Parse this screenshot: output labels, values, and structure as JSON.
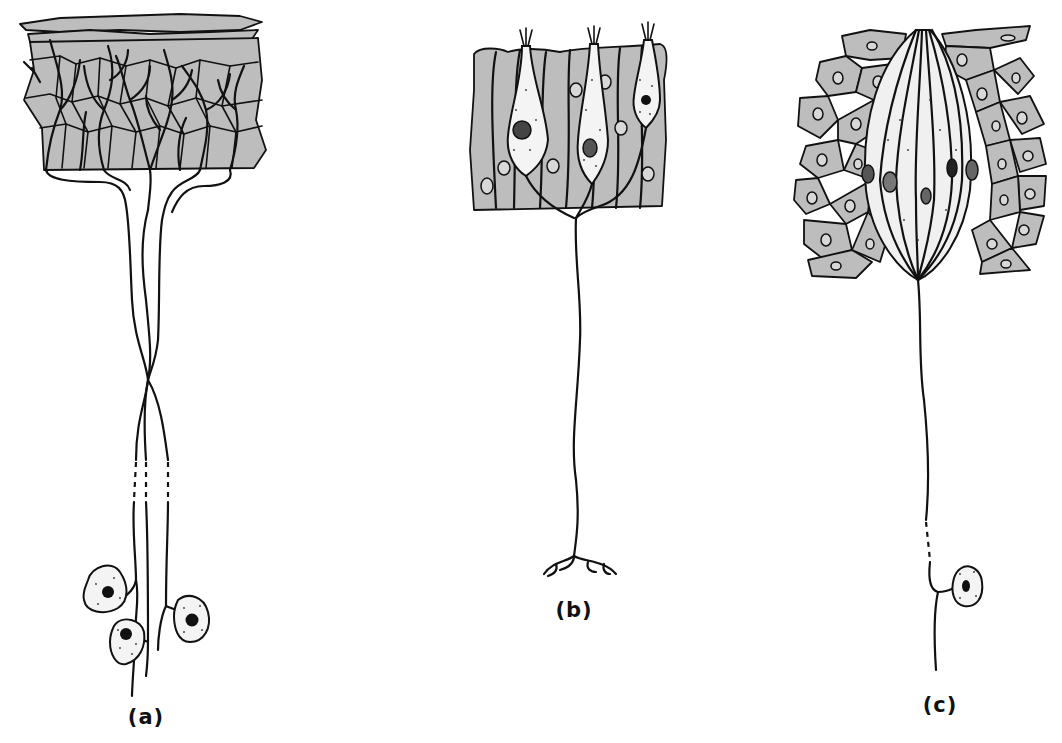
{
  "figure": {
    "colors": {
      "epithelium_fill": "#bdbdbd",
      "line": "#111111",
      "background": "#ffffff"
    },
    "panels": [
      {
        "id": "a",
        "label": "(a)",
        "content": "Free nerve endings branching through stratified epithelium; three neurons with cell bodies (ganglion) below, axons crossing, dashed segments indicating length"
      },
      {
        "id": "b",
        "label": "(b)",
        "content": "Columnar epithelium with three bipolar receptor neurons whose dendrites reach the surface; single axon descending to branched terminal"
      },
      {
        "id": "c",
        "label": "(c)",
        "content": "Taste-bud-like cluster of receptor cells embedded in epithelium with nerve fiber descending to a cell body"
      }
    ]
  }
}
